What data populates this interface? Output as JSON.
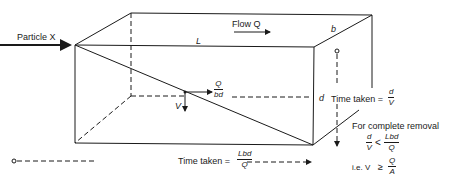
{
  "diagram": {
    "type": "settling-tank-schematic",
    "labels": {
      "particle": "Particle X",
      "flow": "Flow Q",
      "length": "L",
      "breadth": "b",
      "depth": "d",
      "settling_velocity": "V",
      "horizontal_velocity": {
        "num": "Q",
        "den": "bd"
      }
    },
    "vertical_time": {
      "prefix": "Time taken =",
      "num": "d",
      "den": "V"
    },
    "horizontal_time": {
      "prefix": "Time taken =",
      "num": "Lbd",
      "den": "Q"
    },
    "removal": {
      "heading": "For complete removal",
      "cond1": {
        "lhs_num": "d",
        "lhs_den": "V",
        "op": "<",
        "rhs_num": "Lbd",
        "rhs_den": "Q"
      },
      "cond2": {
        "prefix": "i.e. V",
        "op": "≥",
        "rhs_num": "Q",
        "rhs_den": "A"
      }
    },
    "line_color": "#1a1a1a"
  }
}
